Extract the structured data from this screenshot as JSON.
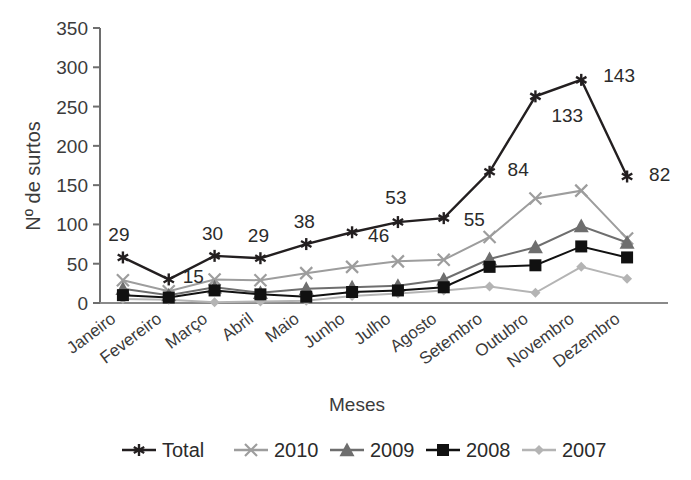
{
  "chart_data": {
    "type": "line",
    "title": "",
    "xlabel": "Meses",
    "ylabel": "Nº de surtos",
    "categories": [
      "Janeiro",
      "Fevereiro",
      "Março",
      "Abril",
      "Maio",
      "Junho",
      "Julho",
      "Agosto",
      "Setembro",
      "Outubro",
      "Novembro",
      "Dezembro"
    ],
    "ylim": [
      0,
      350
    ],
    "ytick_labels": [
      "0",
      "50",
      "100",
      "150",
      "200",
      "250",
      "300",
      "350"
    ],
    "ytick_values": [
      0,
      50,
      100,
      150,
      200,
      250,
      300,
      350
    ],
    "ytick_step": 50,
    "grid": false,
    "legend_position": "bottom",
    "series": [
      {
        "name": "Total",
        "marker": "asterisk",
        "color": "#231f20",
        "values": [
          58,
          30,
          60,
          57,
          75,
          90,
          103,
          108,
          167,
          263,
          284,
          161
        ]
      },
      {
        "name": "2010",
        "marker": "x-cross",
        "color": "#9d9d9d",
        "values": [
          29,
          15,
          30,
          29,
          38,
          46,
          53,
          55,
          84,
          133,
          143,
          82
        ]
      },
      {
        "name": "2009",
        "marker": "triangle",
        "color": "#6e6e6e",
        "values": [
          18,
          10,
          20,
          13,
          18,
          20,
          22,
          30,
          56,
          71,
          98,
          77
        ]
      },
      {
        "name": "2008",
        "marker": "square",
        "color": "#111111",
        "values": [
          10,
          7,
          16,
          11,
          8,
          14,
          16,
          20,
          46,
          48,
          72,
          58
        ]
      },
      {
        "name": "2007",
        "marker": "diamond",
        "color": "#b4b4b4",
        "values": [
          5,
          4,
          1,
          2,
          3,
          9,
          12,
          16,
          21,
          13,
          46,
          31
        ]
      }
    ],
    "data_labels": {
      "series": "2010",
      "values": [
        "29",
        "15",
        "30",
        "29",
        "38",
        "46",
        "53",
        "55",
        "84",
        "133",
        "143",
        "82"
      ]
    }
  },
  "legend": {
    "entries": [
      {
        "label": "Total",
        "marker": "asterisk",
        "color": "#231f20"
      },
      {
        "label": "2010",
        "marker": "x-cross",
        "color": "#9d9d9d"
      },
      {
        "label": "2009",
        "marker": "triangle",
        "color": "#6e6e6e"
      },
      {
        "label": "2008",
        "marker": "square",
        "color": "#111111"
      },
      {
        "label": "2007",
        "marker": "diamond",
        "color": "#b4b4b4"
      }
    ]
  },
  "axes": {
    "y_title": "Nº de surtos",
    "x_title": "Meses"
  }
}
